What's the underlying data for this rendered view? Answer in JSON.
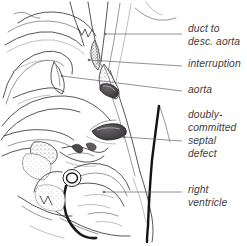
{
  "figure": {
    "background_color": "#ffffff",
    "ink_color": "#3a3639",
    "text_color": "#3f3c3e",
    "catheter_color": "#141214",
    "width": 247,
    "height": 246
  },
  "annotations": [
    {
      "id": "duct-to-desc-aorta",
      "lines": [
        "duct to",
        "desc. aorta"
      ],
      "line1": "duct to",
      "line2": "desc. aorta",
      "text_x": 188,
      "text_y": 32,
      "leader": {
        "x1": 105,
        "y1": 34,
        "x2": 182,
        "y2": 34
      }
    },
    {
      "id": "interruption",
      "lines": [
        "interruption"
      ],
      "line1": "interruption",
      "text_x": 188,
      "text_y": 66,
      "leader": {
        "x1": 89,
        "y1": 60,
        "x2": 182,
        "y2": 66
      }
    },
    {
      "id": "aorta",
      "lines": [
        "aorta"
      ],
      "line1": "aorta",
      "text_x": 188,
      "text_y": 92,
      "leader": {
        "x1": 62,
        "y1": 76,
        "x2": 182,
        "y2": 91
      }
    },
    {
      "id": "doubly-committed-septal-defect",
      "lines": [
        "doubly-",
        "committed",
        "septal",
        "defect"
      ],
      "line1": "doubly-",
      "line2": "committed",
      "line3": "septal",
      "line4": "defect",
      "text_x": 188,
      "text_y": 117,
      "leader": {
        "x1": 124,
        "y1": 137,
        "x2": 182,
        "y2": 141
      }
    },
    {
      "id": "right-ventricle",
      "lines": [
        "right",
        "ventricle"
      ],
      "line1": "right",
      "line2": "ventricle",
      "text_x": 188,
      "text_y": 192,
      "leader": {
        "x1": 104,
        "y1": 192,
        "x2": 182,
        "y2": 192
      }
    }
  ],
  "structures": [
    {
      "id": "duct",
      "label": "duct to descending aorta"
    },
    {
      "id": "interruption-zone",
      "label": "aortic interruption"
    },
    {
      "id": "aorta",
      "label": "aorta"
    },
    {
      "id": "septal-defect-opening",
      "label": "doubly-committed septal defect"
    },
    {
      "id": "right-ventricle-wall",
      "label": "right ventricle"
    },
    {
      "id": "catheter",
      "label": "catheter"
    }
  ]
}
